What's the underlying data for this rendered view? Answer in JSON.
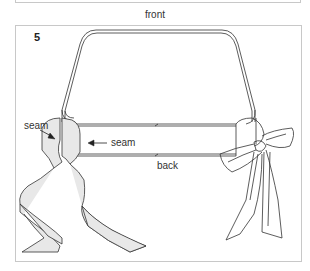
{
  "figure": {
    "step_number": "5",
    "labels": {
      "front": "front",
      "back": "back",
      "seam_left": "seam",
      "seam_inner": "seam"
    },
    "colors": {
      "line": "#333333",
      "ribbon_fill": "#e8e8e8",
      "frame_border": "#c8c8c8"
    }
  }
}
